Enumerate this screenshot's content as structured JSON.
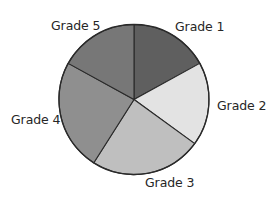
{
  "chart_data": {
    "type": "pie",
    "title": "",
    "start_angle_deg": 0,
    "direction": "clockwise",
    "categories": [
      "Grade 1",
      "Grade 2",
      "Grade 3",
      "Grade 4",
      "Grade 5"
    ],
    "values": [
      17,
      18,
      24,
      24,
      17
    ],
    "unit": "percent (estimated from slice angles)",
    "colors": [
      "#5f5f5f",
      "#e3e3e3",
      "#bfbfbf",
      "#8f8f8f",
      "#777777"
    ],
    "legend": "none (labels placed outside slices)",
    "grid": false
  },
  "labels": {
    "grade1": "Grade 1",
    "grade2": "Grade 2",
    "grade3": "Grade 3",
    "grade4": "Grade 4",
    "grade5": "Grade 5"
  },
  "geometry": {
    "cx": 134,
    "cy": 99.5,
    "r": 75
  }
}
